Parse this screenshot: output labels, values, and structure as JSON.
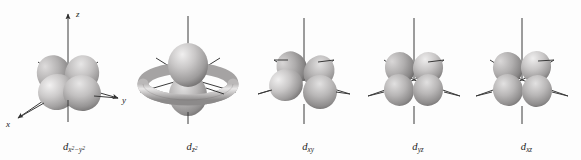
{
  "figure": {
    "name": "five-d-orbitals-shapes",
    "background_color": "#fdfdfd",
    "width": 581,
    "height": 160,
    "style": "grayscale 3D shaded lobes on coordinate axes"
  },
  "axes": {
    "z_label": "z",
    "y_label": "y",
    "x_label": "x",
    "shown_on_first_only": true,
    "arrowheads": true,
    "line_color": "#3a3a3a"
  },
  "palette": {
    "lobe_light": "#eceaea",
    "lobe_mid": "#bdbbbb",
    "lobe_dark": "#8f8d8d",
    "lobe_shadow": "#6e6c6c",
    "axis": "#3a3a3a",
    "text": "#1c1c1c"
  },
  "orbitals": [
    {
      "id": "d-x2-y2",
      "label_base": "d",
      "label_sub": "x",
      "label_sub_sup1": "2",
      "label_minus": "−y",
      "label_sub_sup2": "2",
      "label_plain": "d x²−y²",
      "lobes": 4,
      "has_torus": false,
      "orientation": "lobes along x and y axes",
      "x": 0,
      "width": 140
    },
    {
      "id": "d-z2",
      "label_base": "d",
      "label_sub": "z",
      "label_sub_sup1": "2",
      "label_plain": "d z²",
      "lobes": 2,
      "has_torus": true,
      "orientation": "two lobes along z with equatorial torus",
      "x": 128,
      "width": 124
    },
    {
      "id": "d-xy",
      "label_base": "d",
      "label_sub": "xy",
      "label_plain": "d xy",
      "lobes": 4,
      "has_torus": false,
      "orientation": "lobes between x and y axes",
      "x": 248,
      "width": 116
    },
    {
      "id": "d-yz",
      "label_base": "d",
      "label_sub": "yz",
      "label_plain": "d yz",
      "lobes": 4,
      "has_torus": false,
      "orientation": "lobes between y and z axes",
      "x": 360,
      "width": 112
    },
    {
      "id": "d-xz",
      "label_base": "d",
      "label_sub": "xz",
      "label_plain": "d xz",
      "lobes": 4,
      "has_torus": false,
      "orientation": "lobes between x and z axes",
      "x": 468,
      "width": 113
    }
  ]
}
